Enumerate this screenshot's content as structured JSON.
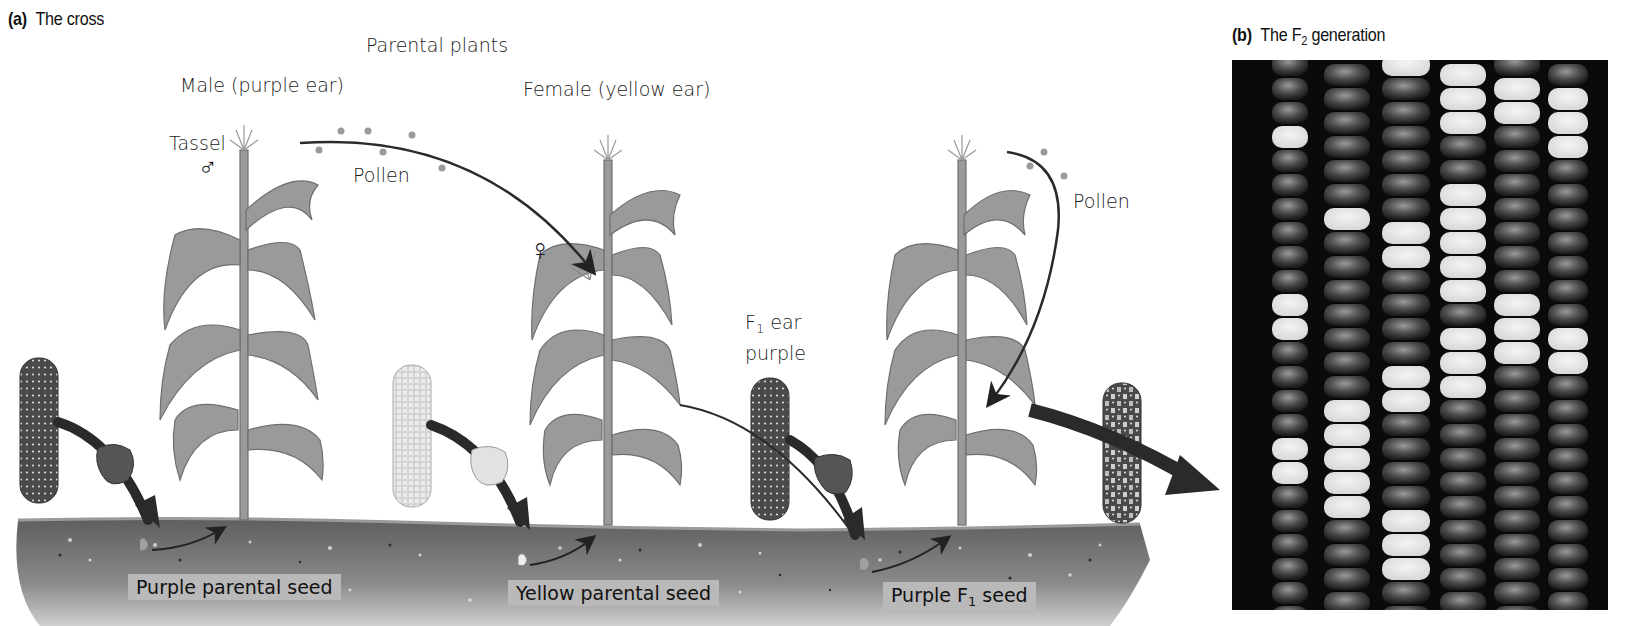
{
  "panel_a": {
    "letter": "(a)",
    "title": "The cross",
    "heading": "Parental plants",
    "male_label": "Male (purple ear)",
    "female_label": "Female (yellow ear)",
    "tassel_label": "Tassel",
    "male_symbol": "♂",
    "female_symbol": "♀",
    "pollen_label_1": "Pollen",
    "pollen_label_2": "Pollen",
    "f1_ear_label_line1_prefix": "F",
    "f1_ear_label_line1_sub": "1",
    "f1_ear_label_line1_suffix": " ear",
    "f1_ear_label_line2": "purple",
    "seed_labels": {
      "purple_parental": "Purple parental seed",
      "yellow_parental": "Yellow parental seed",
      "purple_f1_prefix": "Purple F",
      "purple_f1_sub": "1",
      "purple_f1_suffix": " seed"
    }
  },
  "panel_b": {
    "letter": "(b)",
    "title_prefix": "The F",
    "title_sub": "2",
    "title_suffix": " generation"
  },
  "colors": {
    "soil": "#6e6e6e",
    "soil_label_bg": "#b9b9b9",
    "plant": "#8f8f8f",
    "purple_ear": "#555555",
    "yellow_ear": "#e6e6e6",
    "arrow": "#2a2a2a",
    "photo_bg": "#0a0a0a"
  }
}
